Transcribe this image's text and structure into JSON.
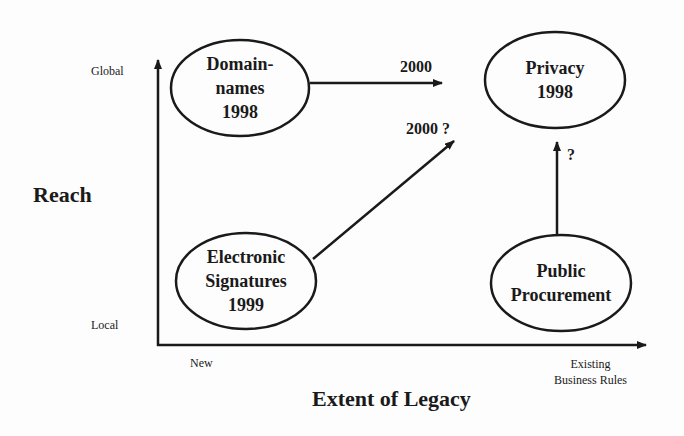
{
  "axes": {
    "y_title": "Reach",
    "y_top": "Global",
    "y_bottom": "Local",
    "x_title": "Extent of Legacy",
    "x_left": "New",
    "x_right_line1": "Existing",
    "x_right_line2": "Business Rules"
  },
  "nodes": [
    {
      "id": "domain-names",
      "line1": "Domain-",
      "line2": "names",
      "line3": "1998"
    },
    {
      "id": "privacy",
      "line1": "Privacy",
      "line2": "1998"
    },
    {
      "id": "electronic-signatures",
      "line1": "Electronic",
      "line2": "Signatures",
      "line3": "1999"
    },
    {
      "id": "public-procurement",
      "line1": "Public",
      "line2": "Procurement"
    }
  ],
  "edges": [
    {
      "from": "domain-names",
      "label": "2000"
    },
    {
      "from": "electronic-signatures",
      "label": "2000 ?"
    },
    {
      "from": "public-procurement",
      "to": "privacy",
      "label": "?"
    }
  ],
  "colors": {
    "ink": "#1a1a1a",
    "background": "#fdfdfd"
  }
}
